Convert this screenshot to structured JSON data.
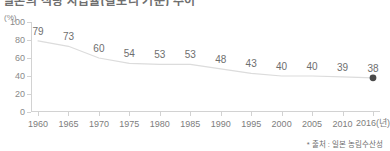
{
  "title": {
    "text": "일본의 식량 자급률(칼로리 기준) 추이",
    "clipped": true
  },
  "source_note": "* 출처 : 일본 농림수산성",
  "chart_data": {
    "type": "line",
    "title": "일본의 식량 자급률(칼로리 기준) 추이",
    "xlabel": "(년)",
    "ylabel": "(%)",
    "unit": "(%)",
    "x_axis_suffix": "(년)",
    "categories": [
      "1960",
      "1965",
      "1970",
      "1975",
      "1980",
      "1985",
      "1990",
      "1995",
      "2000",
      "2005",
      "2010",
      "2016"
    ],
    "values": [
      79,
      73,
      60,
      54,
      53,
      53,
      48,
      43,
      40,
      40,
      39,
      38
    ],
    "point_labels": [
      "79",
      "73",
      "60",
      "54",
      "53",
      "53",
      "48",
      "43",
      "40",
      "40",
      "39",
      "38"
    ],
    "ylim": [
      0,
      100
    ],
    "yticks": [
      100,
      80,
      60,
      40,
      20,
      0
    ],
    "ytick_labels": [
      "100",
      "80",
      "60",
      "40",
      "20",
      "0"
    ],
    "grid": false,
    "legend": false,
    "line_color": "#dcdcdc",
    "marker": {
      "index": 11,
      "label": "38",
      "color": "#4a4a4a",
      "shape": "circle"
    }
  }
}
